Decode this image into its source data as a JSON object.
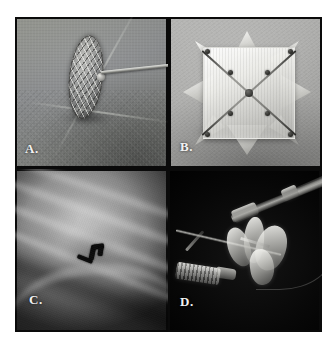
{
  "figure": {
    "type": "four-panel-medical-figure",
    "layout": "2x2 grid",
    "background": "#0a0a0a",
    "frame": {
      "x": 15,
      "y": 17,
      "width": 307,
      "height": 315
    },
    "label_color": "#f2f2f2"
  },
  "panels": [
    {
      "id": "A",
      "label": "A.",
      "label_position": "bottom-left",
      "modality": "photograph",
      "position": "top-left",
      "background_color": "#86888a",
      "description": "Self-expanding wire-mesh occluder disc mounted on a thin metallic delivery wire, photographed on a greenish-gray surgical drape with a visible fabric seam.",
      "elements": [
        "mesh-occluder-disc",
        "delivery-wire",
        "hub-connector",
        "surgical-drape-background",
        "drape-seam"
      ]
    },
    {
      "id": "B",
      "label": "B.",
      "label_position": "bottom-left",
      "modality": "photograph",
      "position": "top-right",
      "background_color": "#a9a9a7",
      "description": "White fabric square patch device with eight pointed star petals and dark crossing X-shaped nitinol struts meeting at a central hub.",
      "elements": [
        "fabric-patch-square",
        "star-petals",
        "x-struts",
        "central-hub",
        "strut-nodes"
      ]
    },
    {
      "id": "C",
      "label": "C.",
      "label_position": "bottom-left",
      "modality": "fluoroscopy",
      "position": "bottom-left",
      "background_color": "#5e5e5e",
      "description": "Fluoroscopic chest image showing ribs and diaphragm with a small dark radiopaque implanted device in the mid-field.",
      "elements": [
        "rib-shadows",
        "diaphragm-contour",
        "radiopaque-device",
        "image-vignette"
      ]
    },
    {
      "id": "D",
      "label": "D.",
      "label_position": "bottom-left",
      "modality": "photograph",
      "position": "bottom-right",
      "background_color": "#070707",
      "description": "Catheter-based delivery system on a black background: catheter shaft with hub connectors, a threaded luer-lock fitting, a guidewire, and the partially deployed white device petals.",
      "elements": [
        "catheter-shaft",
        "hub-connector",
        "luer-lock-fitting",
        "guidewire",
        "device-petals",
        "device-stem"
      ]
    }
  ]
}
